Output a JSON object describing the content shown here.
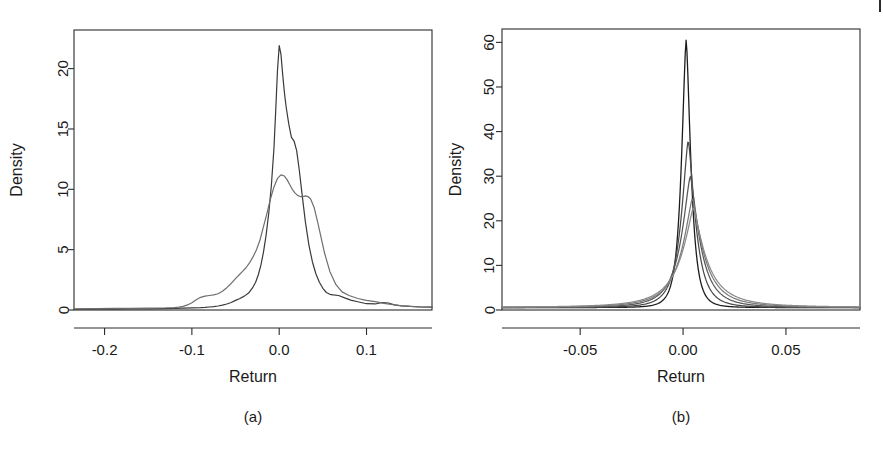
{
  "figure": {
    "background_color": "#ffffff",
    "panels": [
      {
        "id": "a",
        "caption": "(a)",
        "xlabel": "Return",
        "ylabel": "Density"
      },
      {
        "id": "b",
        "caption": "(b)",
        "xlabel": "Return",
        "ylabel": "Density"
      }
    ]
  },
  "chart_data": [
    {
      "type": "line",
      "panel": "a",
      "title": "",
      "xlabel": "Return",
      "ylabel": "Density",
      "xlim": [
        -0.235,
        0.175
      ],
      "ylim": [
        -0.6,
        23.2
      ],
      "xticks": [
        -0.2,
        -0.1,
        0.0,
        0.1
      ],
      "xticklabels": [
        "-0.2",
        "-0.1",
        "0.0",
        "0.1"
      ],
      "yticks": [
        0,
        5,
        10,
        15,
        20
      ],
      "yticklabels": [
        "0",
        "5",
        "10",
        "15",
        "20"
      ],
      "grid": false,
      "legend": "none",
      "series": [
        {
          "name": "density-dark",
          "color": "#3a3a3a",
          "width": 1.2,
          "x": [
            -0.235,
            -0.21,
            -0.19,
            -0.17,
            -0.15,
            -0.13,
            -0.12,
            -0.11,
            -0.1,
            -0.09,
            -0.085,
            -0.08,
            -0.075,
            -0.07,
            -0.065,
            -0.06,
            -0.055,
            -0.05,
            -0.045,
            -0.04,
            -0.035,
            -0.03,
            -0.027,
            -0.024,
            -0.021,
            -0.018,
            -0.015,
            -0.012,
            -0.009,
            -0.006,
            -0.004,
            -0.002,
            0.0,
            0.002,
            0.004,
            0.006,
            0.008,
            0.011,
            0.014,
            0.017,
            0.02,
            0.023,
            0.026,
            0.03,
            0.034,
            0.038,
            0.042,
            0.046,
            0.05,
            0.054,
            0.058,
            0.062,
            0.068,
            0.075,
            0.082,
            0.09,
            0.1,
            0.11,
            0.118,
            0.125,
            0.132,
            0.14,
            0.15,
            0.16,
            0.175
          ],
          "y": [
            0.06,
            0.07,
            0.08,
            0.09,
            0.1,
            0.12,
            0.13,
            0.15,
            0.18,
            0.2,
            0.22,
            0.25,
            0.28,
            0.33,
            0.4,
            0.5,
            0.62,
            0.8,
            0.95,
            1.15,
            1.4,
            1.9,
            2.3,
            2.9,
            3.7,
            4.8,
            6.2,
            8.0,
            10.3,
            13.4,
            16.5,
            19.8,
            21.9,
            21.2,
            19.5,
            18.0,
            16.8,
            15.4,
            14.3,
            14.0,
            13.2,
            11.6,
            9.7,
            7.3,
            5.4,
            4.0,
            3.0,
            2.3,
            1.8,
            1.45,
            1.3,
            1.25,
            1.2,
            1.0,
            0.82,
            0.68,
            0.52,
            0.5,
            0.62,
            0.58,
            0.42,
            0.35,
            0.3,
            0.26,
            0.24
          ],
          "peak": 22.0,
          "peak_x": 0.0
        },
        {
          "name": "density-light",
          "color": "#6e6e6e",
          "width": 1.2,
          "x": [
            -0.235,
            -0.21,
            -0.19,
            -0.17,
            -0.15,
            -0.13,
            -0.12,
            -0.115,
            -0.11,
            -0.105,
            -0.1,
            -0.095,
            -0.09,
            -0.085,
            -0.08,
            -0.075,
            -0.07,
            -0.065,
            -0.06,
            -0.055,
            -0.05,
            -0.046,
            -0.042,
            -0.038,
            -0.034,
            -0.03,
            -0.026,
            -0.022,
            -0.018,
            -0.014,
            -0.01,
            -0.006,
            -0.002,
            0.002,
            0.006,
            0.009,
            0.012,
            0.015,
            0.018,
            0.021,
            0.024,
            0.027,
            0.03,
            0.033,
            0.036,
            0.04,
            0.044,
            0.048,
            0.052,
            0.058,
            0.065,
            0.072,
            0.08,
            0.09,
            0.1,
            0.11,
            0.12,
            0.13,
            0.14,
            0.15,
            0.16,
            0.175
          ],
          "y": [
            0.1,
            0.12,
            0.13,
            0.14,
            0.15,
            0.17,
            0.2,
            0.24,
            0.3,
            0.42,
            0.6,
            0.85,
            1.05,
            1.15,
            1.2,
            1.25,
            1.35,
            1.55,
            1.85,
            2.2,
            2.6,
            2.9,
            3.2,
            3.5,
            3.9,
            4.4,
            5.0,
            5.8,
            6.9,
            8.0,
            9.2,
            10.2,
            10.9,
            11.2,
            11.1,
            10.8,
            10.4,
            10.0,
            9.7,
            9.5,
            9.4,
            9.4,
            9.45,
            9.4,
            9.2,
            8.5,
            7.3,
            6.0,
            4.7,
            3.2,
            2.1,
            1.5,
            1.2,
            0.95,
            0.8,
            0.7,
            0.55,
            0.45,
            0.35,
            0.3,
            0.27,
            0.25
          ],
          "peak": 11.2,
          "peak_x": 0.002
        }
      ]
    },
    {
      "type": "line",
      "panel": "b",
      "title": "",
      "xlabel": "Return",
      "ylabel": "Density",
      "xlim": [
        -0.088,
        0.086
      ],
      "ylim": [
        -1.6,
        63.0
      ],
      "xticks": [
        -0.05,
        0.0,
        0.05
      ],
      "xticklabels": [
        "-0.05",
        "0.00",
        "0.05"
      ],
      "yticks": [
        0,
        10,
        20,
        30,
        40,
        50,
        60
      ],
      "yticklabels": [
        "0",
        "10",
        "20",
        "30",
        "40",
        "50",
        "60"
      ],
      "grid": false,
      "legend": "none",
      "series": [
        {
          "name": "density-1-black",
          "color": "#1c1c1c",
          "width": 1.3,
          "peak": 60.5,
          "peak_x": 0.0015,
          "scale": 0.004,
          "baseline": 0.55,
          "shape_exp": 1.55
        },
        {
          "name": "density-2-darkgray",
          "color": "#4a4a4a",
          "width": 1.25,
          "peak": 38.0,
          "peak_x": 0.0025,
          "scale": 0.0062,
          "baseline": 0.55,
          "shape_exp": 1.45
        },
        {
          "name": "density-3-midgray",
          "color": "#585858",
          "width": 1.25,
          "peak": 30.0,
          "peak_x": 0.0035,
          "scale": 0.0082,
          "baseline": 0.55,
          "shape_exp": 1.38
        },
        {
          "name": "density-4-gray",
          "color": "#7a7a7a",
          "width": 1.25,
          "peak": 25.0,
          "peak_x": 0.0045,
          "scale": 0.0098,
          "baseline": 0.6,
          "shape_exp": 1.32
        },
        {
          "name": "density-5-lightgray",
          "color": "#8a8a8a",
          "width": 1.25,
          "peak": 23.0,
          "peak_x": 0.005,
          "scale": 0.0112,
          "baseline": 0.6,
          "shape_exp": 1.28
        }
      ]
    }
  ]
}
